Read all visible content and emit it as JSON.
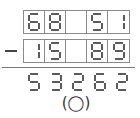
{
  "problem": {
    "operator": "minus",
    "top_row": [
      "6",
      "8",
      "",
      "5",
      "1"
    ],
    "bottom_row": [
      "1",
      "5",
      "",
      "8",
      "9"
    ],
    "result": [
      "5",
      "3",
      "2",
      "6",
      "2"
    ],
    "answer_placeholder": "(◯)"
  },
  "colors": {
    "digit": "#333333",
    "box_border": "#8a8a8a",
    "rule": "#777777"
  }
}
